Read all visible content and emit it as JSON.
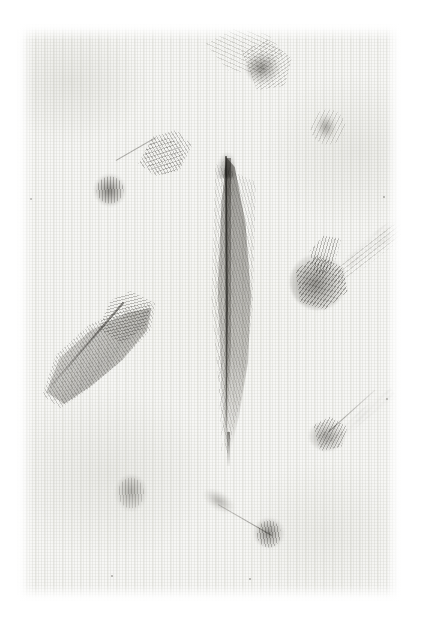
{
  "image": {
    "title": "Feather specimen plate",
    "subject": "Collection of bird feathers arranged on textured paper",
    "medium": "photographic scan",
    "width_px": 429,
    "height_px": 624
  },
  "palette": {
    "page_white": "#ffffff",
    "plate_paper": "#f7f7f5",
    "weave_shadow": "#cdcdc8",
    "feather_dark": "#56544f",
    "feather_mid": "#8a8884",
    "feather_light": "#bebcb8"
  },
  "plate": {
    "left_px": 17,
    "top_px": 24,
    "width_px": 384,
    "height_px": 577,
    "texture": "woven canvas / laid paper"
  },
  "specimens": [
    {
      "id": "feather-main",
      "label": "Central flight feather",
      "type": "contour / flight feather",
      "orientation": "vertical",
      "center": {
        "x": 227,
        "y": 308
      },
      "length_px": 300,
      "width_px": 48,
      "tone": "mid grey-brown",
      "notes": "dark rachis running full length, narrow asymmetric vanes, tapering calamus at base"
    },
    {
      "id": "feather-top-center",
      "label": "Top-centre downy feather",
      "type": "down / plumule",
      "orientation": "barbs sweeping left",
      "center": {
        "x": 238,
        "y": 80
      },
      "length_px": 120,
      "width_px": 80,
      "tone": "pale grey with darker core"
    },
    {
      "id": "feather-top-right",
      "label": "Top-right small down tuft",
      "type": "down / plumule",
      "orientation": "compact",
      "center": {
        "x": 328,
        "y": 128
      },
      "length_px": 44,
      "width_px": 44,
      "tone": "faint grey"
    },
    {
      "id": "feather-upper-left",
      "label": "Upper-left down feather with barb spray",
      "type": "down / semiplume",
      "orientation": "diagonal, lower-left to upper-right",
      "center": {
        "x": 127,
        "y": 187
      },
      "length_px": 110,
      "width_px": 95,
      "tone": "dark compact base, pale open barbs"
    },
    {
      "id": "feather-left-plume",
      "label": "Large left plume",
      "type": "semiplume",
      "orientation": "diagonal, lower-left to upper-right",
      "center": {
        "x": 106,
        "y": 348
      },
      "length_px": 132,
      "width_px": 132,
      "tone": "soft mid grey, finely striated barbs"
    },
    {
      "id": "feather-right-center",
      "label": "Right-centre down feather",
      "type": "down / plumule",
      "orientation": "dense base lower-left, barbs trailing upper-right",
      "center": {
        "x": 340,
        "y": 284
      },
      "length_px": 140,
      "width_px": 116,
      "tone": "darkest specimen on the plate"
    },
    {
      "id": "feather-lower-right",
      "label": "Lower-right down feather",
      "type": "down / plumule",
      "orientation": "diagonal, lower-left to upper-right",
      "center": {
        "x": 344,
        "y": 435
      },
      "length_px": 96,
      "width_px": 86,
      "tone": "light grey"
    },
    {
      "id": "feather-bottom-left",
      "label": "Bottom-left oval tuft",
      "type": "down tuft",
      "orientation": "upright oval",
      "center": {
        "x": 134,
        "y": 493
      },
      "length_px": 48,
      "width_px": 50,
      "tone": "soft pale grey"
    },
    {
      "id": "feather-bottom-center",
      "label": "Bottom-centre filoplume",
      "type": "filoplume",
      "orientation": "diagonal, upper-left to lower-right",
      "center": {
        "x": 232,
        "y": 538
      },
      "length_px": 108,
      "width_px": 72,
      "tone": "thin shaft with small dark terminal tuft"
    }
  ],
  "specks": [
    {
      "x": 30,
      "y": 198,
      "size": 2
    },
    {
      "x": 383,
      "y": 196,
      "size": 2
    },
    {
      "x": 111,
      "y": 575,
      "size": 2
    },
    {
      "x": 249,
      "y": 578,
      "size": 2
    },
    {
      "x": 386,
      "y": 398,
      "size": 2
    }
  ]
}
